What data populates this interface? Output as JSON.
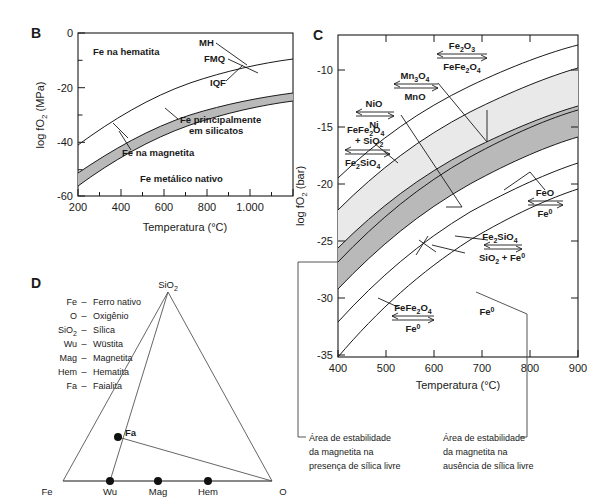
{
  "figure": {
    "panels": [
      "B",
      "C",
      "D"
    ]
  },
  "panelB": {
    "letter": "B",
    "xlabel": "Temperatura (°C)",
    "ylabel": "log fO",
    "ylabel_sub": "2",
    "ylabel_unit": " (MPa)",
    "xticks": [
      "200",
      "400",
      "600",
      "800",
      "1.000"
    ],
    "yticks": [
      "0",
      "-20",
      "-40",
      "-60"
    ],
    "curve_labels": [
      "MH",
      "FMQ",
      "IQF"
    ],
    "regions": [
      "Fe na hematita",
      "Fe principalmente",
      "em silicatos",
      "Fe na magnetita",
      "Fe metálico nativo"
    ]
  },
  "panelC": {
    "letter": "C",
    "xlabel": "Temperatura (°C)",
    "ylabel": "log fO",
    "ylabel_sub": "2",
    "ylabel_unit": "  (bar)",
    "xticks": [
      "400",
      "500",
      "600",
      "700",
      "800",
      "900"
    ],
    "yticks": [
      "-10",
      "-15",
      "-20",
      "-25",
      "-30",
      "-35"
    ],
    "buffers": [
      {
        "name": "hematite-magnetite",
        "top": "Fe",
        "top_sub": "2",
        "top_tail": "O",
        "top_sub2": "3",
        "bottom": "FeFe",
        "bottom_sub": "2",
        "bottom_tail": "O",
        "bottom_sub2": "4"
      },
      {
        "name": "manganese",
        "top": "Mn",
        "top_sub": "3",
        "top_tail": "O",
        "top_sub2": "4",
        "bottom": "MnO",
        "bottom_sub": "",
        "bottom_tail": "",
        "bottom_sub2": ""
      },
      {
        "name": "nickel",
        "top": "NiO",
        "top_sub": "",
        "top_tail": "",
        "top_sub2": "",
        "bottom": "Ni",
        "bottom_sub": "",
        "bottom_tail": "",
        "bottom_sub2": ""
      },
      {
        "name": "fayalite-magnetite-quartz",
        "top": "FeFe",
        "top_sub": "2",
        "top_tail": "O",
        "top_sub2": "4",
        "top_line2": "+ SiO",
        "top_line2_sub": "2",
        "bottom": "Fe",
        "bottom_sub": "2",
        "bottom_tail": "SiO",
        "bottom_sub2": "4"
      },
      {
        "name": "wustite-iron",
        "top": "FeO",
        "top_sub": "",
        "top_tail": "",
        "top_sub2": "",
        "bottom": "Fe",
        "bottom_sub": "",
        "bottom_tail": "",
        "bottom_sup": "0"
      },
      {
        "name": "fayalite-iron-silica",
        "top": "Fe",
        "top_sub": "2",
        "top_tail": "SiO",
        "top_sub2": "4",
        "bottom": "SiO",
        "bottom_sub": "2",
        "bottom_tail": " + Fe",
        "bottom_sup": "0"
      },
      {
        "name": "magnetite-iron",
        "top": "FeFe",
        "top_sub": "2",
        "top_tail": "O",
        "top_sub2": "4",
        "bottom": "Fe",
        "bottom_sub": "",
        "bottom_tail": "",
        "bottom_sup": "0"
      }
    ],
    "region_label": "Fe",
    "region_label_sup": "0",
    "caption_left": [
      "Área de estabilidade",
      "da magnetita na",
      "presença de sílica livre"
    ],
    "caption_right": [
      "Área de estabilidade",
      "da magnetita na",
      "ausência de sílica livre"
    ]
  },
  "panelD": {
    "letter": "D",
    "legend": [
      {
        "sym": "Fe",
        "sym_sub": "",
        "dash": "–",
        "name": "Ferro nativo"
      },
      {
        "sym": "O",
        "sym_sub": "",
        "dash": "–",
        "name": "Oxigênio"
      },
      {
        "sym": "SiO",
        "sym_sub": "2",
        "dash": "–",
        "name": "Sílica"
      },
      {
        "sym": "Wu",
        "sym_sub": "",
        "dash": "–",
        "name": "Wüstita"
      },
      {
        "sym": "Mag",
        "sym_sub": "",
        "dash": "–",
        "name": "Magnetita"
      },
      {
        "sym": "Hem",
        "sym_sub": "",
        "dash": "–",
        "name": "Hematita"
      },
      {
        "sym": "Fa",
        "sym_sub": "",
        "dash": "–",
        "name": "Faialita"
      }
    ],
    "apex_top": "SiO",
    "apex_top_sub": "2",
    "apex_left": "Fe",
    "apex_right": "O",
    "points": [
      "Wu",
      "Mag",
      "Hem",
      "Fa"
    ]
  },
  "colors": {
    "band_light": "#e9e9e9",
    "band_dark": "#b9b9b9",
    "line": "#1a1a1a",
    "bracket": "#555555"
  }
}
